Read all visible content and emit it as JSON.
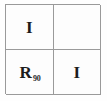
{
  "figure": {
    "kind": "operator-matrix",
    "rows": 2,
    "columns": 2,
    "background_color": "#fdfdfd",
    "border_color": "#9a9a9a",
    "text_color": "#1c1c1c"
  },
  "cells": [
    {
      "position": "top-left",
      "base": "I",
      "subscript": "",
      "empty": false
    },
    {
      "position": "top-right",
      "base": "",
      "subscript": "",
      "empty": true
    },
    {
      "position": "bottom-left",
      "base": "R",
      "subscript": "90",
      "empty": false
    },
    {
      "position": "bottom-right",
      "base": "I",
      "subscript": "",
      "empty": false
    }
  ]
}
